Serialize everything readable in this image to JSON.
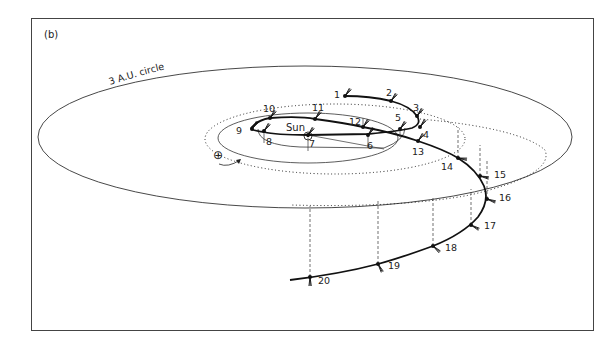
{
  "panel_label": "(b)",
  "circle_label": "3 A.U. circle",
  "sun_label": "Sun",
  "earth_symbol": "⊕",
  "colors": {
    "ink": "#1a1a1a",
    "frame": "#444444",
    "background": "#ffffff"
  },
  "points": [
    {
      "n": "1",
      "x": 345,
      "y": 96
    },
    {
      "n": "2",
      "x": 391,
      "y": 101
    },
    {
      "n": "3",
      "x": 417,
      "y": 116
    },
    {
      "n": "4",
      "x": 420,
      "y": 127
    },
    {
      "n": "5",
      "x": 400,
      "y": 129
    },
    {
      "n": "6",
      "x": 368,
      "y": 135
    },
    {
      "n": "7",
      "x": 308,
      "y": 135
    },
    {
      "n": "8",
      "x": 264,
      "y": 131
    },
    {
      "n": "9",
      "x": 252,
      "y": 129
    },
    {
      "n": "10",
      "x": 270,
      "y": 118
    },
    {
      "n": "11",
      "x": 315,
      "y": 119
    },
    {
      "n": "12",
      "x": 363,
      "y": 127
    },
    {
      "n": "13",
      "x": 418,
      "y": 141
    },
    {
      "n": "14",
      "x": 458,
      "y": 158
    },
    {
      "n": "15",
      "x": 480,
      "y": 176
    },
    {
      "n": "16",
      "x": 487,
      "y": 199
    },
    {
      "n": "17",
      "x": 471,
      "y": 225
    },
    {
      "n": "18",
      "x": 433,
      "y": 246
    },
    {
      "n": "19",
      "x": 378,
      "y": 264
    },
    {
      "n": "20",
      "x": 310,
      "y": 277
    }
  ]
}
